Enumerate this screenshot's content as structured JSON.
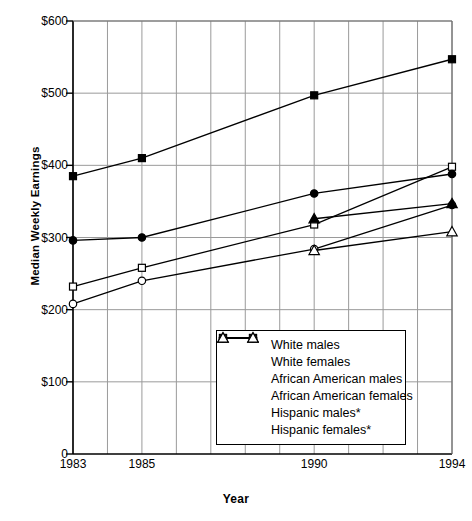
{
  "chart_data": {
    "type": "line",
    "title": "",
    "xlabel": "Year",
    "ylabel": "Median Weekly Earnings",
    "xlim": [
      1983,
      1994
    ],
    "ylim": [
      0,
      600
    ],
    "yticks": [
      "0",
      "$100",
      "$200",
      "$300",
      "$400",
      "$500",
      "$600"
    ],
    "ytick_values": [
      0,
      100,
      200,
      300,
      400,
      500,
      600
    ],
    "xticks": [
      "1983",
      "1985",
      "1990",
      "1994"
    ],
    "xtick_values": [
      1983,
      1985,
      1990,
      1994
    ],
    "gridlines": "both",
    "grid": true,
    "legend_position": "inside-bottom-center",
    "series": [
      {
        "name": "White males",
        "marker": "filled-square",
        "x": [
          1983,
          1985,
          1990,
          1994
        ],
        "values": [
          385,
          410,
          497,
          547
        ]
      },
      {
        "name": "White females",
        "marker": "open-square",
        "x": [
          1983,
          1985,
          1990,
          1994
        ],
        "values": [
          232,
          258,
          318,
          398
        ]
      },
      {
        "name": "African American males",
        "marker": "filled-circle",
        "x": [
          1983,
          1985,
          1990,
          1994
        ],
        "values": [
          296,
          300,
          361,
          388
        ]
      },
      {
        "name": "African American females",
        "marker": "open-circle",
        "x": [
          1983,
          1985,
          1990,
          1994
        ],
        "values": [
          208,
          240,
          284,
          345
        ]
      },
      {
        "name": "Hispanic males*",
        "marker": "filled-triangle",
        "x": [
          1990,
          1994
        ],
        "values": [
          326,
          347
        ]
      },
      {
        "name": "Hispanic females*",
        "marker": "open-triangle",
        "x": [
          1990,
          1994
        ],
        "values": [
          282,
          308
        ]
      }
    ]
  },
  "legend": {
    "items": [
      {
        "label": "White males",
        "marker": "filled-square"
      },
      {
        "label": "White females",
        "marker": "open-square"
      },
      {
        "label": "African American males",
        "marker": "filled-circle"
      },
      {
        "label": "African American females",
        "marker": "open-circle"
      },
      {
        "label": "Hispanic males*",
        "marker": "filled-triangle"
      },
      {
        "label": "Hispanic females*",
        "marker": "open-triangle"
      }
    ]
  },
  "colors": {
    "line": "#000000",
    "grid": "#9a9a9a",
    "axis": "#000000",
    "background": "#ffffff"
  }
}
